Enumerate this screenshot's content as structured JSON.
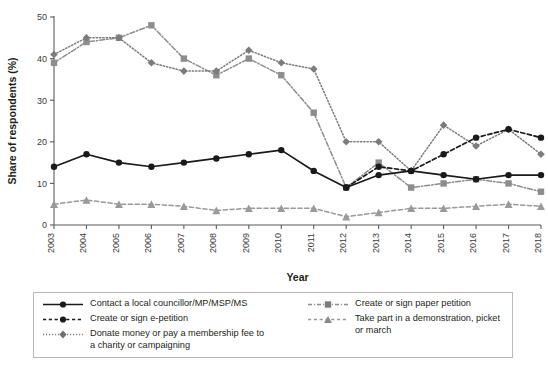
{
  "chart_data": {
    "type": "line",
    "title": "",
    "xlabel": "Year",
    "ylabel": "Share of respondents (%)",
    "categories": [
      "2003",
      "2004",
      "2005",
      "2006",
      "2007",
      "2008",
      "2009",
      "2010",
      "2011",
      "2012",
      "2013",
      "2014",
      "2015",
      "2016",
      "2017",
      "2018"
    ],
    "x": [
      2003,
      2004,
      2005,
      2006,
      2007,
      2008,
      2009,
      2010,
      2011,
      2012,
      2013,
      2014,
      2015,
      2016,
      2017,
      2018
    ],
    "ylim": [
      0,
      50
    ],
    "xlim": [
      2003,
      2018
    ],
    "yticks": [
      "0",
      "10",
      "20",
      "30",
      "40",
      "50"
    ],
    "ytick_values": [
      0,
      10,
      20,
      30,
      40,
      50
    ],
    "grid": false,
    "legend_position": "bottom",
    "series": [
      {
        "name": "Contact a local councillor/MP/MSP/MS",
        "marker": "circle",
        "line": "solid",
        "color": "#1a1a1a",
        "values": [
          14,
          17,
          15,
          14,
          15,
          16,
          17,
          18,
          13,
          9,
          12,
          13,
          12,
          11,
          12,
          12
        ]
      },
      {
        "name": "Create or sign e-petition",
        "marker": "circle",
        "line": "dashed",
        "color": "#1a1a1a",
        "values": [
          null,
          null,
          null,
          null,
          null,
          null,
          null,
          null,
          null,
          9,
          14,
          13,
          17,
          21,
          23,
          21
        ]
      },
      {
        "name": "Donate money or pay a membership fee to a charity or campaigning",
        "marker": "diamond",
        "line": "dotted",
        "color": "#7c7c7c",
        "values": [
          41,
          45,
          45,
          39,
          37,
          37,
          42,
          39,
          37.5,
          20,
          20,
          13,
          24,
          19,
          23,
          17
        ]
      },
      {
        "name": "Create or sign paper petition",
        "marker": "square",
        "line": "dashdot",
        "color": "#8d8d8d",
        "values": [
          39,
          44,
          45,
          48,
          40,
          36,
          40,
          36,
          27,
          9,
          15,
          9,
          10,
          11,
          10,
          8
        ]
      },
      {
        "name": "Take part in a demonstration, picket or march",
        "marker": "triangle",
        "line": "dashed",
        "color": "#9a9a9a",
        "values": [
          5,
          6,
          5,
          5,
          4.5,
          3.5,
          4,
          4,
          4,
          2,
          3,
          4,
          4,
          4.5,
          5,
          4.5
        ]
      }
    ]
  },
  "legend": {
    "left_items": [
      {
        "label": "Contact a local councillor/MP/MSP/MS",
        "label2": ""
      },
      {
        "label": "Create or sign e-petition",
        "label2": ""
      },
      {
        "label": "Donate money or pay a membership fee to",
        "label2": "a charity or campaigning"
      }
    ],
    "right_items": [
      {
        "label": "Create or sign paper petition",
        "label2": ""
      },
      {
        "label": "Take part in a demonstration, picket or march",
        "label2": ""
      }
    ]
  }
}
